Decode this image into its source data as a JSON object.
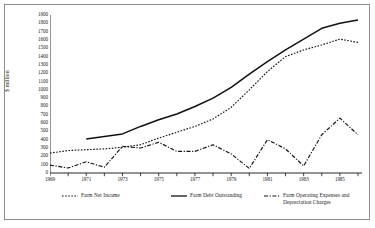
{
  "chart_data": {
    "type": "line",
    "title": "",
    "xlabel": "",
    "ylabel": "$ million",
    "xlim": [
      1969,
      1986
    ],
    "ylim": [
      0,
      1900
    ],
    "ytick_step": 100,
    "grid": false,
    "legend_position": "bottom",
    "yticks": [
      0,
      100,
      200,
      300,
      400,
      500,
      600,
      700,
      800,
      900,
      1000,
      1100,
      1200,
      1300,
      1400,
      1500,
      1600,
      1700,
      1800,
      1900
    ],
    "ytick_labels": [
      "0",
      "100",
      "200",
      "300",
      "400",
      "500",
      "600",
      "700",
      "800",
      "900",
      "1000",
      "1100",
      "1200",
      "1300",
      "1400",
      "1500",
      "1600",
      "1700",
      "1800",
      "1900"
    ],
    "xticks": [
      1969,
      1970,
      1971,
      1972,
      1973,
      1974,
      1975,
      1976,
      1977,
      1978,
      1979,
      1980,
      1981,
      1982,
      1983,
      1984,
      1985,
      1986
    ],
    "xtick_labels": [
      "1969",
      "",
      "1971",
      "",
      "1973",
      "",
      "1975",
      "",
      "1977",
      "",
      "1979",
      "",
      "1981",
      "",
      "1983",
      "",
      "1985",
      ""
    ],
    "series": [
      {
        "name": "Farm Net Income",
        "style": "dotted",
        "color": "#111111",
        "x": [
          1969,
          1970,
          1971,
          1972,
          1973,
          1974,
          1975,
          1976,
          1977,
          1978,
          1979,
          1980,
          1981,
          1982,
          1983,
          1984,
          1985,
          1986
        ],
        "values": [
          240,
          270,
          280,
          290,
          310,
          340,
          420,
          490,
          560,
          650,
          790,
          1000,
          1220,
          1400,
          1480,
          1540,
          1610,
          1570
        ]
      },
      {
        "name": "Farm Debt Outstanding",
        "style": "solid",
        "color": "#111111",
        "x": [
          1971,
          1972,
          1973,
          1974,
          1975,
          1976,
          1977,
          1978,
          1979,
          1980,
          1981,
          1982,
          1983,
          1984,
          1985,
          1986
        ],
        "values": [
          410,
          440,
          470,
          560,
          640,
          710,
          800,
          900,
          1030,
          1190,
          1340,
          1480,
          1610,
          1740,
          1800,
          1840
        ]
      },
      {
        "name": "Farm Operating Expenses and\nDepreciation Charges",
        "style": "dashdot",
        "color": "#111111",
        "x": [
          1969,
          1970,
          1971,
          1972,
          1973,
          1974,
          1975,
          1976,
          1977,
          1978,
          1979,
          1980,
          1981,
          1982,
          1983,
          1984,
          1985,
          1986
        ],
        "values": [
          95,
          60,
          135,
          70,
          320,
          300,
          370,
          260,
          260,
          340,
          230,
          55,
          400,
          290,
          85,
          460,
          660,
          460
        ]
      }
    ]
  },
  "legend": {
    "items": [
      {
        "label": "Farm Net Income",
        "style": "dotted"
      },
      {
        "label": "Farm Debt Outstanding",
        "style": "solid"
      },
      {
        "label": "Farm Operating Expenses and\nDepreciation Charges",
        "style": "dashdot"
      }
    ]
  }
}
